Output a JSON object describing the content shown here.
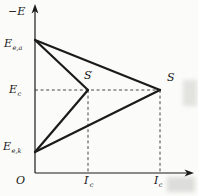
{
  "figure": {
    "colors": {
      "background": "#fbfbf9",
      "line": "#1b1b1b",
      "dashed": "#474747"
    },
    "glyphs": {
      "prime": "′"
    },
    "geometry": {
      "y_axis": {
        "x": 35,
        "y_top": 4,
        "y_bottom": 173
      },
      "x_axis": {
        "y": 173,
        "x_left": 35,
        "x_right": 194
      },
      "vertex_anode": [
        35,
        40
      ],
      "vertex_cathode": [
        35,
        152
      ],
      "point_s_prime": [
        88,
        90
      ],
      "point_s": [
        160,
        90
      ],
      "solid_lines": [
        [
          [
            35,
            40
          ],
          [
            160,
            90
          ]
        ],
        [
          [
            35,
            40
          ],
          [
            88,
            90
          ]
        ],
        [
          [
            35,
            152
          ],
          [
            160,
            90
          ]
        ],
        [
          [
            35,
            152
          ],
          [
            88,
            90
          ]
        ]
      ],
      "dashed_lines": [
        [
          [
            35,
            90
          ],
          [
            160,
            90
          ]
        ],
        [
          [
            88,
            90
          ],
          [
            88,
            173
          ]
        ],
        [
          [
            160,
            90
          ],
          [
            160,
            173
          ]
        ]
      ]
    },
    "labels": [
      {
        "name": "y-axis-label",
        "text": "−E",
        "x": 8,
        "y": 6
      },
      {
        "name": "anode-potential-label",
        "main": "E",
        "sub": "e,a",
        "x": 4,
        "y": 38
      },
      {
        "name": "corrosion-potential-label",
        "main": "E",
        "sub": "c",
        "x": 9,
        "y": 84
      },
      {
        "name": "cathode-potential-label",
        "main": "E",
        "sub": "e,k",
        "x": 3,
        "y": 141
      },
      {
        "name": "origin-label",
        "text": "O",
        "x": 16,
        "y": 175
      },
      {
        "name": "point-s-prime-label",
        "main": "S",
        "prime": true,
        "x": 84,
        "y": 70
      },
      {
        "name": "point-s-label",
        "main": "S",
        "x": 167,
        "y": 72
      },
      {
        "name": "current-i-prime-label",
        "main": "I",
        "prime": true,
        "sub": "c",
        "x": 84,
        "y": 175
      },
      {
        "name": "current-i-label",
        "main": "I",
        "sub": "c",
        "x": 154,
        "y": 175
      }
    ]
  },
  "chart_data": {
    "type": "line",
    "xlabel": "I (current)",
    "ylabel": "−E (potential)",
    "x_tick_labels": [
      "O",
      "I′c",
      "Ic"
    ],
    "y_tick_labels": [
      "E e,k",
      "E c",
      "E e,a"
    ],
    "x_tick_positions": [
      0,
      0.42,
      1
    ],
    "y_tick_positions": [
      0.16,
      0.62,
      1
    ],
    "grid": false,
    "legend": "none",
    "series": [
      {
        "name": "anodic polarization line to S",
        "x": [
          0,
          1
        ],
        "y": [
          1,
          0.62
        ]
      },
      {
        "name": "cathodic polarization line to S",
        "x": [
          0,
          1
        ],
        "y": [
          0.16,
          0.62
        ]
      },
      {
        "name": "anodic polarization line to S'",
        "x": [
          0,
          0.42
        ],
        "y": [
          1,
          0.62
        ]
      },
      {
        "name": "cathodic polarization line to S'",
        "x": [
          0,
          0.42
        ],
        "y": [
          0.16,
          0.62
        ]
      }
    ],
    "points": [
      {
        "name": "S",
        "x": 1,
        "y": 0.62
      },
      {
        "name": "S'",
        "x": 0.42,
        "y": 0.62
      }
    ],
    "annotations": [
      "Dashed guides drop from S and S' to the current axis at Ic and I′c",
      "Horizontal dashed guide marks the common corrosion potential Ec"
    ]
  }
}
